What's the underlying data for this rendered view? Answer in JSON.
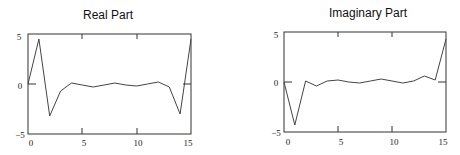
{
  "chart_data": [
    {
      "type": "line",
      "title": "Real Part",
      "xlabel": "",
      "ylabel": "",
      "x": [
        0,
        1,
        2,
        3,
        4,
        5,
        6,
        7,
        8,
        9,
        10,
        11,
        12,
        13,
        14,
        15
      ],
      "values": [
        0,
        4.5,
        -3.2,
        -0.7,
        0.1,
        -0.1,
        -0.3,
        -0.1,
        0.1,
        -0.1,
        -0.2,
        0,
        0.2,
        -0.3,
        -3.0,
        4.5
      ],
      "xlim": [
        0,
        15
      ],
      "ylim": [
        -5,
        5
      ],
      "xticks": [
        "0",
        "5",
        "10",
        "15"
      ],
      "yticks": [
        "5",
        "0",
        "-5"
      ],
      "grid": false,
      "zero_line_marks": true
    },
    {
      "type": "line",
      "title": "Imaginary Part",
      "xlabel": "",
      "ylabel": "",
      "x": [
        0,
        1,
        2,
        3,
        4,
        5,
        6,
        7,
        8,
        9,
        10,
        11,
        12,
        13,
        14,
        15
      ],
      "values": [
        0,
        -4.3,
        0.1,
        -0.4,
        0.1,
        0.2,
        0,
        -0.1,
        0.1,
        0.3,
        0.1,
        -0.1,
        0.1,
        0.6,
        0.2,
        4.3
      ],
      "xlim": [
        0,
        15
      ],
      "ylim": [
        -5,
        5
      ],
      "xticks": [
        "0",
        "5",
        "10",
        "15"
      ],
      "yticks": [
        "5",
        "0",
        "-5"
      ],
      "grid": false,
      "zero_line_marks": true
    }
  ],
  "charts": [
    {
      "title": "Real Part",
      "ytick_top": "5",
      "ytick_mid": "0",
      "ytick_bot": "−5",
      "xt0": "0",
      "xt5": "5",
      "xt10": "10",
      "xt15": "15"
    },
    {
      "title": "Imaginary Part",
      "ytick_top": "5",
      "ytick_mid": "0",
      "ytick_bot": "−5",
      "xt0": "0",
      "xt5": "5",
      "xt10": "10",
      "xt15": "15"
    }
  ]
}
